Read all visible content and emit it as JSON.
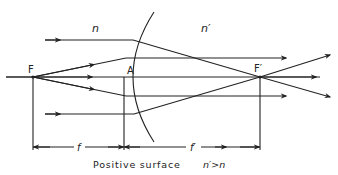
{
  "labels": {
    "n": "n",
    "n_prime": "n′",
    "F": "F",
    "A": "A",
    "F_prime": "F′",
    "f": "f",
    "f_prime": "f′",
    "caption_main": "Positive surface",
    "caption_condition": "n′>n"
  },
  "colors": {
    "ink": "#222222",
    "background": "#ffffff"
  }
}
